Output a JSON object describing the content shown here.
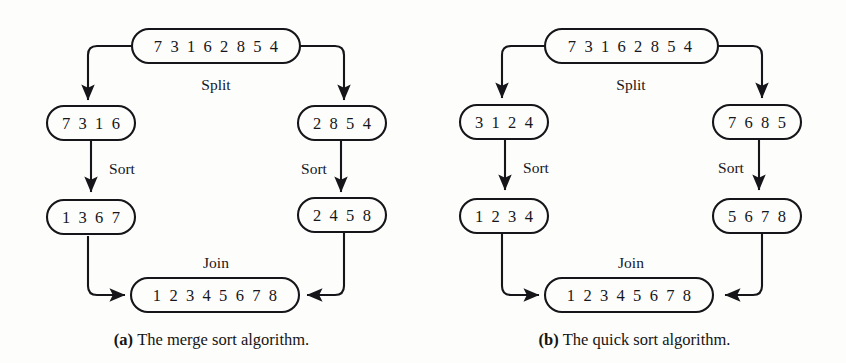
{
  "page": {
    "background_color": "#fdfdfc",
    "stroke_color": "#16161a",
    "text_color": "#16161a"
  },
  "panels": [
    {
      "id": "a",
      "caption_marker": "(a)",
      "caption_text": "The merge sort algorithm.",
      "nodes": {
        "root": "7 3 1 6 2 8 5 4",
        "left_unsorted": "7 3 1 6",
        "right_unsorted": "2 8 5 4",
        "left_sorted": "1 3 6 7",
        "right_sorted": "2 4 5 8",
        "joined": "1 2 3 4 5 6 7 8"
      },
      "edge_labels": {
        "split": "Split",
        "sort_left": "Sort",
        "sort_right": "Sort",
        "join": "Join"
      }
    },
    {
      "id": "b",
      "caption_marker": "(b)",
      "caption_text": "The quick sort algorithm.",
      "nodes": {
        "root": "7 3 1 6 2 8 5 4",
        "left_unsorted": "3 1 2 4",
        "right_unsorted": "7 6 8 5",
        "left_sorted": "1 2 3 4",
        "right_sorted": "5 6 7 8",
        "joined": "1 2 3 4 5 6 7 8"
      },
      "edge_labels": {
        "split": "Split",
        "sort_left": "Sort",
        "sort_right": "Sort",
        "join": "Join"
      }
    }
  ]
}
